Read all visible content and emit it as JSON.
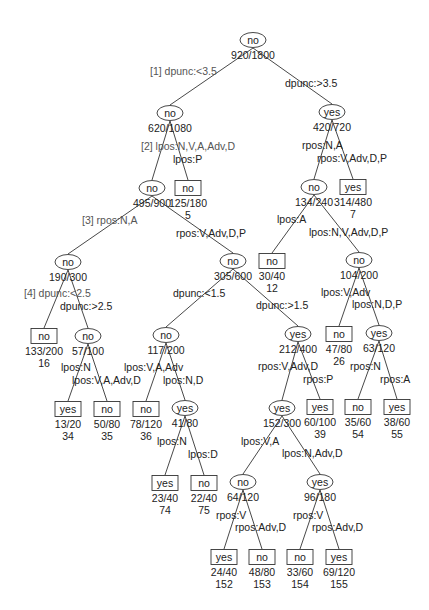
{
  "diagram": {
    "type": "decision-tree",
    "nodes": [
      {
        "id": "n1",
        "shape": "ellipse",
        "label": "no",
        "counts": "920/1800",
        "leaf_id": "",
        "x": 253,
        "y": 40
      },
      {
        "id": "n2",
        "shape": "ellipse",
        "label": "no",
        "counts": "620/1080",
        "leaf_id": "",
        "x": 170,
        "y": 113
      },
      {
        "id": "n3",
        "shape": "ellipse",
        "label": "yes",
        "counts": "420/720",
        "leaf_id": "",
        "x": 332,
        "y": 112
      },
      {
        "id": "n4",
        "shape": "ellipse",
        "label": "no",
        "counts": "495/900",
        "leaf_id": "",
        "x": 152,
        "y": 188
      },
      {
        "id": "n5",
        "shape": "box",
        "label": "no",
        "counts": "125/180",
        "leaf_id": "5",
        "x": 188,
        "y": 188
      },
      {
        "id": "n6",
        "shape": "ellipse",
        "label": "no",
        "counts": "134/240",
        "leaf_id": "",
        "x": 314,
        "y": 187
      },
      {
        "id": "n7",
        "shape": "box",
        "label": "yes",
        "counts": "314/480",
        "leaf_id": "7",
        "x": 353,
        "y": 187
      },
      {
        "id": "n8",
        "shape": "ellipse",
        "label": "no",
        "counts": "190/300",
        "leaf_id": "",
        "x": 68,
        "y": 262
      },
      {
        "id": "n9",
        "shape": "ellipse",
        "label": "no",
        "counts": "305/600",
        "leaf_id": "",
        "x": 233,
        "y": 261
      },
      {
        "id": "n10",
        "shape": "box",
        "label": "no",
        "counts": "30/40",
        "leaf_id": "12",
        "x": 272,
        "y": 261
      },
      {
        "id": "n11",
        "shape": "ellipse",
        "label": "no",
        "counts": "104/200",
        "leaf_id": "",
        "x": 359,
        "y": 260
      },
      {
        "id": "n12",
        "shape": "box",
        "label": "no",
        "counts": "133/200",
        "leaf_id": "16",
        "x": 44,
        "y": 336
      },
      {
        "id": "n13",
        "shape": "ellipse",
        "label": "no",
        "counts": "57/100",
        "leaf_id": "",
        "x": 88,
        "y": 336
      },
      {
        "id": "n14",
        "shape": "ellipse",
        "label": "no",
        "counts": "117/200",
        "leaf_id": "",
        "x": 166,
        "y": 335
      },
      {
        "id": "n15",
        "shape": "ellipse",
        "label": "yes",
        "counts": "212/400",
        "leaf_id": "",
        "x": 298,
        "y": 334
      },
      {
        "id": "n16",
        "shape": "box",
        "label": "no",
        "counts": "47/80",
        "leaf_id": "26",
        "x": 339,
        "y": 334
      },
      {
        "id": "n17",
        "shape": "ellipse",
        "label": "yes",
        "counts": "63/120",
        "leaf_id": "",
        "x": 379,
        "y": 333
      },
      {
        "id": "n18",
        "shape": "box",
        "label": "yes",
        "counts": "13/20",
        "leaf_id": "34",
        "x": 68,
        "y": 409
      },
      {
        "id": "n19",
        "shape": "box",
        "label": "no",
        "counts": "50/80",
        "leaf_id": "35",
        "x": 107,
        "y": 409
      },
      {
        "id": "n20",
        "shape": "box",
        "label": "no",
        "counts": "78/120",
        "leaf_id": "36",
        "x": 146,
        "y": 409
      },
      {
        "id": "n21",
        "shape": "ellipse",
        "label": "yes",
        "counts": "41/80",
        "leaf_id": "",
        "x": 185,
        "y": 408
      },
      {
        "id": "n22",
        "shape": "ellipse",
        "label": "yes",
        "counts": "152/300",
        "leaf_id": "",
        "x": 282,
        "y": 408
      },
      {
        "id": "n23",
        "shape": "box",
        "label": "yes",
        "counts": "60/100",
        "leaf_id": "39",
        "x": 320,
        "y": 407
      },
      {
        "id": "n24",
        "shape": "box",
        "label": "no",
        "counts": "35/60",
        "leaf_id": "54",
        "x": 358,
        "y": 407
      },
      {
        "id": "n25",
        "shape": "box",
        "label": "yes",
        "counts": "38/60",
        "leaf_id": "55",
        "x": 397,
        "y": 407
      },
      {
        "id": "n26",
        "shape": "box",
        "label": "yes",
        "counts": "23/40",
        "leaf_id": "74",
        "x": 165,
        "y": 483
      },
      {
        "id": "n27",
        "shape": "box",
        "label": "no",
        "counts": "22/40",
        "leaf_id": "75",
        "x": 204,
        "y": 483
      },
      {
        "id": "n28",
        "shape": "ellipse",
        "label": "no",
        "counts": "64/120",
        "leaf_id": "",
        "x": 243,
        "y": 482
      },
      {
        "id": "n29",
        "shape": "ellipse",
        "label": "yes",
        "counts": "96/180",
        "leaf_id": "",
        "x": 320,
        "y": 482
      },
      {
        "id": "n30",
        "shape": "box",
        "label": "yes",
        "counts": "24/40",
        "leaf_id": "152",
        "x": 224,
        "y": 557
      },
      {
        "id": "n31",
        "shape": "box",
        "label": "no",
        "counts": "48/80",
        "leaf_id": "153",
        "x": 262,
        "y": 557
      },
      {
        "id": "n32",
        "shape": "box",
        "label": "no",
        "counts": "33/60",
        "leaf_id": "154",
        "x": 300,
        "y": 557
      },
      {
        "id": "n33",
        "shape": "box",
        "label": "yes",
        "counts": "69/120",
        "leaf_id": "155",
        "x": 339,
        "y": 557
      }
    ],
    "edges": [
      {
        "from": "n1",
        "to": "n2",
        "label": "[1] dpunc:<3.5",
        "lx": 150,
        "ly": 75,
        "anchor": "start",
        "split": true
      },
      {
        "from": "n1",
        "to": "n3",
        "label": "dpunc:>3.5",
        "lx": 285,
        "ly": 87,
        "anchor": "start",
        "split": false
      },
      {
        "from": "n2",
        "to": "n4",
        "label": "[2] lpos:N,V,A,Adv,D",
        "lx": 141,
        "ly": 150,
        "anchor": "start",
        "split": true
      },
      {
        "from": "n2",
        "to": "n5",
        "label": "lpos:P",
        "lx": 173,
        "ly": 163,
        "anchor": "start",
        "split": false
      },
      {
        "from": "n3",
        "to": "n6",
        "label": "rpos:N,A",
        "lx": 302,
        "ly": 149,
        "anchor": "start",
        "split": false
      },
      {
        "from": "n3",
        "to": "n7",
        "label": "rpos:V,Adv,D,P",
        "lx": 317,
        "ly": 162,
        "anchor": "start",
        "split": false
      },
      {
        "from": "n4",
        "to": "n8",
        "label": "[3] rpos:N,A",
        "lx": 82,
        "ly": 224,
        "anchor": "start",
        "split": true
      },
      {
        "from": "n4",
        "to": "n9",
        "label": "rpos:V,Adv,D,P",
        "lx": 176,
        "ly": 237,
        "anchor": "start",
        "split": false
      },
      {
        "from": "n6",
        "to": "n10",
        "label": "lpos:A",
        "lx": 277,
        "ly": 223,
        "anchor": "start",
        "split": false
      },
      {
        "from": "n6",
        "to": "n11",
        "label": "lpos:N,V,Adv,D,P",
        "lx": 309,
        "ly": 236,
        "anchor": "start",
        "split": false
      },
      {
        "from": "n8",
        "to": "n12",
        "label": "[4] dpunc:<2.5",
        "lx": 24,
        "ly": 297,
        "anchor": "start",
        "split": true
      },
      {
        "from": "n8",
        "to": "n13",
        "label": "dpunc:>2.5",
        "lx": 60,
        "ly": 310,
        "anchor": "start",
        "split": false
      },
      {
        "from": "n9",
        "to": "n14",
        "label": "dpunc:<1.5",
        "lx": 173,
        "ly": 297,
        "anchor": "start",
        "split": false
      },
      {
        "from": "n9",
        "to": "n15",
        "label": "dpunc:>1.5",
        "lx": 256,
        "ly": 309,
        "anchor": "start",
        "split": false
      },
      {
        "from": "n11",
        "to": "n16",
        "label": "lpos:V,Adv",
        "lx": 321,
        "ly": 296,
        "anchor": "start",
        "split": false
      },
      {
        "from": "n11",
        "to": "n17",
        "label": "lpos:N,D,P",
        "lx": 352,
        "ly": 308,
        "anchor": "start",
        "split": false
      },
      {
        "from": "n13",
        "to": "n18",
        "label": "lpos:N",
        "lx": 61,
        "ly": 371,
        "anchor": "start",
        "split": false
      },
      {
        "from": "n13",
        "to": "n19",
        "label": "lpos:V,A,Adv,D",
        "lx": 72,
        "ly": 384,
        "anchor": "start",
        "split": false
      },
      {
        "from": "n14",
        "to": "n20",
        "label": "lpos:V,A,Adv",
        "lx": 124,
        "ly": 371,
        "anchor": "start",
        "split": false
      },
      {
        "from": "n14",
        "to": "n21",
        "label": "lpos:N,D",
        "lx": 163,
        "ly": 384,
        "anchor": "start",
        "split": false
      },
      {
        "from": "n15",
        "to": "n22",
        "label": "rpos:V,Adv,D",
        "lx": 258,
        "ly": 370,
        "anchor": "start",
        "split": false
      },
      {
        "from": "n15",
        "to": "n23",
        "label": "rpos:P",
        "lx": 303,
        "ly": 383,
        "anchor": "start",
        "split": false
      },
      {
        "from": "n17",
        "to": "n24",
        "label": "rpos:N",
        "lx": 350,
        "ly": 370,
        "anchor": "start",
        "split": false
      },
      {
        "from": "n17",
        "to": "n25",
        "label": "rpos:A",
        "lx": 380,
        "ly": 383,
        "anchor": "start",
        "split": false
      },
      {
        "from": "n21",
        "to": "n26",
        "label": "lpos:N",
        "lx": 157,
        "ly": 445,
        "anchor": "start",
        "split": false
      },
      {
        "from": "n21",
        "to": "n27",
        "label": "lpos:D",
        "lx": 188,
        "ly": 458,
        "anchor": "start",
        "split": false
      },
      {
        "from": "n22",
        "to": "n28",
        "label": "lpos:V,A",
        "lx": 241,
        "ly": 445,
        "anchor": "start",
        "split": false
      },
      {
        "from": "n22",
        "to": "n29",
        "label": "lpos:N,Adv,D",
        "lx": 282,
        "ly": 457,
        "anchor": "start",
        "split": false
      },
      {
        "from": "n28",
        "to": "n30",
        "label": "rpos:V",
        "lx": 216,
        "ly": 519,
        "anchor": "start",
        "split": false
      },
      {
        "from": "n28",
        "to": "n31",
        "label": "rpos:Adv,D",
        "lx": 235,
        "ly": 531,
        "anchor": "start",
        "split": false
      },
      {
        "from": "n29",
        "to": "n32",
        "label": "rpos:V",
        "lx": 293,
        "ly": 519,
        "anchor": "start",
        "split": false
      },
      {
        "from": "n29",
        "to": "n33",
        "label": "rpos:Adv,D",
        "lx": 312,
        "ly": 531,
        "anchor": "start",
        "split": false
      }
    ]
  }
}
